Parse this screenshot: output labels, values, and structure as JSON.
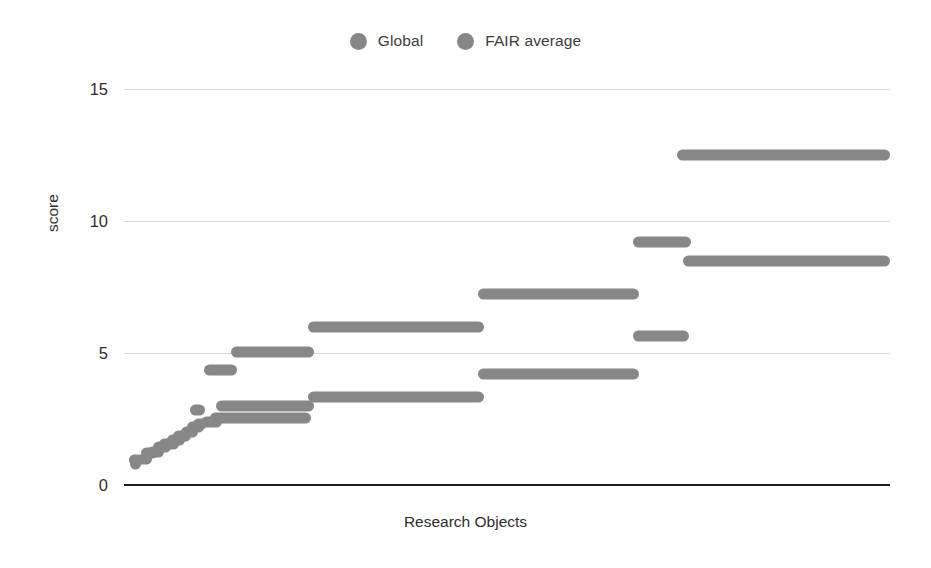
{
  "chart_data": {
    "type": "scatter",
    "title": "",
    "xlabel": "Research Objects",
    "ylabel": "score",
    "ylim": [
      0,
      16.1
    ],
    "yticks": [
      0,
      5,
      10,
      15
    ],
    "ytick_labels": [
      "0",
      "5",
      "10",
      "15"
    ],
    "xlim": [
      0,
      1000
    ],
    "xticks": [],
    "xtick_labels": [],
    "grid": "horizontal",
    "legend_position": "top-center",
    "marker": "circle",
    "series": [
      {
        "name": "Global",
        "color": "#878787",
        "segments": [
          {
            "x_start": 8,
            "x_end": 22,
            "y": 0.8
          },
          {
            "x_start": 18,
            "x_end": 36,
            "y": 1.0
          },
          {
            "x_start": 30,
            "x_end": 52,
            "y": 1.25
          },
          {
            "x_start": 46,
            "x_end": 72,
            "y": 1.55
          },
          {
            "x_start": 64,
            "x_end": 88,
            "y": 1.85
          },
          {
            "x_start": 82,
            "x_end": 104,
            "y": 2.2
          },
          {
            "x_start": 100,
            "x_end": 128,
            "y": 2.4
          },
          {
            "x_start": 120,
            "x_end": 248,
            "y": 3.0
          },
          {
            "x_start": 240,
            "x_end": 470,
            "y": 3.35
          },
          {
            "x_start": 462,
            "x_end": 672,
            "y": 4.2
          },
          {
            "x_start": 664,
            "x_end": 738,
            "y": 5.65
          },
          {
            "x_start": 730,
            "x_end": 1000,
            "y": 8.5
          }
        ]
      },
      {
        "name": "FAIR average",
        "color": "#878787",
        "segments": [
          {
            "x_start": 6,
            "x_end": 26,
            "y": 0.95
          },
          {
            "x_start": 22,
            "x_end": 44,
            "y": 1.2
          },
          {
            "x_start": 38,
            "x_end": 62,
            "y": 1.45
          },
          {
            "x_start": 56,
            "x_end": 80,
            "y": 1.7
          },
          {
            "x_start": 74,
            "x_end": 96,
            "y": 2.0
          },
          {
            "x_start": 90,
            "x_end": 108,
            "y": 2.3
          },
          {
            "x_start": 86,
            "x_end": 106,
            "y": 2.85
          },
          {
            "x_start": 104,
            "x_end": 148,
            "y": 4.35
          },
          {
            "x_start": 112,
            "x_end": 244,
            "y": 2.55
          },
          {
            "x_start": 140,
            "x_end": 248,
            "y": 5.05
          },
          {
            "x_start": 240,
            "x_end": 470,
            "y": 6.0
          },
          {
            "x_start": 462,
            "x_end": 672,
            "y": 7.25
          },
          {
            "x_start": 664,
            "x_end": 740,
            "y": 9.2
          },
          {
            "x_start": 722,
            "x_end": 1000,
            "y": 12.5
          }
        ]
      }
    ]
  },
  "legend": {
    "items": [
      {
        "label": "Global",
        "color": "#878787"
      },
      {
        "label": "FAIR average",
        "color": "#878787"
      }
    ]
  },
  "axes": {
    "y_title": "score",
    "x_title": "Research Objects"
  }
}
